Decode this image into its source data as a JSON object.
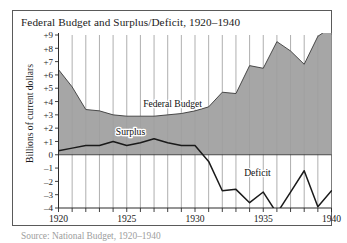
{
  "figure": {
    "title": "Federal Budget and Surplus/Deficit, 1920–1940",
    "source_note": "Source: National Budget, 1920–1940",
    "ylabel": "Billions of current dollars"
  },
  "labels": {
    "federal_budget": "Federal Budget",
    "surplus": "Surplus",
    "deficit": "Deficit"
  },
  "colors": {
    "area_fill": "#9e9e9e",
    "area_stroke": "#3a3a3a",
    "line": "#1a1a1a",
    "gridline": "#8c8c8c",
    "axis": "#2b2b2b",
    "frame": "#5a5a5a",
    "background": "#ffffff",
    "text": "#1b1b1b"
  },
  "axes": {
    "y_ticks": [
      "+9",
      "+8",
      "+7",
      "+6",
      "+5",
      "+4",
      "+3",
      "+2",
      "+1",
      "0",
      "–1",
      "–2",
      "–3",
      "–4"
    ],
    "y_tick_values": [
      9,
      8,
      7,
      6,
      5,
      4,
      3,
      2,
      1,
      0,
      -1,
      -2,
      -3,
      -4
    ],
    "x_ticks_major": [
      "1920",
      "1925",
      "1930",
      "1935",
      "1940"
    ],
    "x_tick_values_major": [
      1920,
      1925,
      1930,
      1935,
      1940
    ],
    "ylim": [
      -4,
      9
    ],
    "xlim": [
      1920,
      1940
    ],
    "grid": "vertical-yearly"
  },
  "chart_data": {
    "type": "area",
    "title": "Federal Budget and Surplus/Deficit, 1920–1940",
    "xlabel": "",
    "ylabel": "Billions of current dollars",
    "xlim": [
      1920,
      1940
    ],
    "ylim": [
      -4,
      9
    ],
    "grid": true,
    "legend": "inline-annotations",
    "x": [
      1920,
      1921,
      1922,
      1923,
      1924,
      1925,
      1926,
      1927,
      1928,
      1929,
      1930,
      1931,
      1932,
      1933,
      1934,
      1935,
      1936,
      1937,
      1938,
      1939,
      1940
    ],
    "series": [
      {
        "name": "Federal Budget",
        "type": "area",
        "unit": "billions of current dollars",
        "values": [
          6.4,
          5.1,
          3.4,
          3.3,
          3.0,
          2.9,
          2.9,
          2.9,
          3.0,
          3.1,
          3.3,
          3.6,
          4.7,
          4.6,
          6.7,
          6.5,
          8.5,
          7.8,
          6.8,
          8.9,
          9.6
        ]
      },
      {
        "name": "Surplus/Deficit",
        "type": "line",
        "unit": "billions of current dollars",
        "values": [
          0.3,
          0.5,
          0.7,
          0.7,
          1.0,
          0.7,
          0.9,
          1.2,
          0.9,
          0.7,
          0.7,
          -0.5,
          -2.7,
          -2.6,
          -3.6,
          -2.8,
          -4.4,
          -2.8,
          -1.2,
          -3.9,
          -2.7
        ]
      }
    ],
    "annotations": [
      {
        "text": "Federal Budget",
        "x": 1926.2,
        "y": 3.6
      },
      {
        "text": "Surplus",
        "x": 1924.2,
        "y": 1.5
      },
      {
        "text": "Deficit",
        "x": 1933.6,
        "y": -1.6
      }
    ]
  }
}
